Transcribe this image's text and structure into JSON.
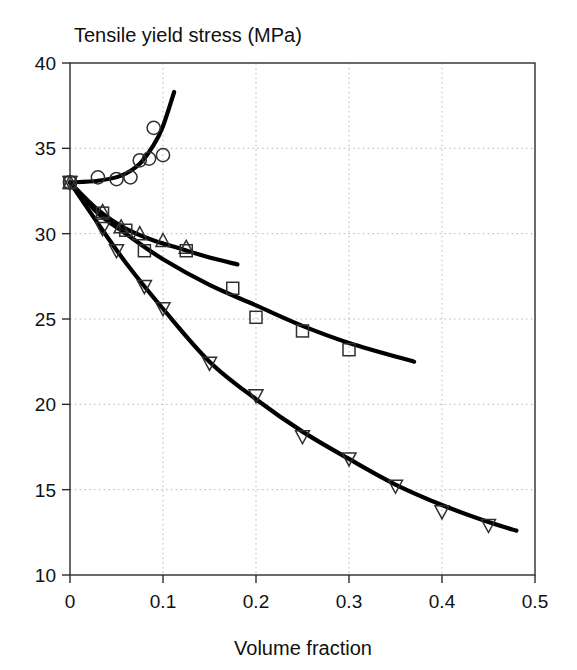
{
  "chart_data": {
    "type": "scatter",
    "title": "Tensile yield stress (MPa)",
    "xlabel": "Volume fraction",
    "ylabel": "Tensile yield stress (MPa)",
    "xlim": [
      0,
      0.5
    ],
    "ylim": [
      10,
      40
    ],
    "xticks": [
      0,
      0.1,
      0.2,
      0.3,
      0.4,
      0.5
    ],
    "xtick_labels": [
      "0",
      "0.1",
      "0.2",
      "0.3",
      "0.4",
      "0.5"
    ],
    "yticks": [
      10,
      15,
      20,
      25,
      30,
      35,
      40
    ],
    "ytick_labels": [
      "10",
      "15",
      "20",
      "25",
      "30",
      "35",
      "40"
    ],
    "grid": true,
    "legend": "none",
    "series": [
      {
        "name": "circles-rising",
        "marker": "circle",
        "points": [
          {
            "x": 0.0,
            "y": 33.0
          },
          {
            "x": 0.03,
            "y": 33.3
          },
          {
            "x": 0.05,
            "y": 33.2
          },
          {
            "x": 0.065,
            "y": 33.3
          },
          {
            "x": 0.075,
            "y": 34.3
          },
          {
            "x": 0.085,
            "y": 34.4
          },
          {
            "x": 0.09,
            "y": 36.2
          },
          {
            "x": 0.1,
            "y": 34.6
          }
        ],
        "curve": [
          {
            "x": 0.0,
            "y": 33.0
          },
          {
            "x": 0.03,
            "y": 33.1
          },
          {
            "x": 0.055,
            "y": 33.4
          },
          {
            "x": 0.075,
            "y": 34.1
          },
          {
            "x": 0.09,
            "y": 35.2
          },
          {
            "x": 0.1,
            "y": 36.3
          },
          {
            "x": 0.112,
            "y": 38.3
          }
        ]
      },
      {
        "name": "up-triangles",
        "marker": "triangle-up",
        "points": [
          {
            "x": 0.0,
            "y": 33.0
          },
          {
            "x": 0.035,
            "y": 31.3
          },
          {
            "x": 0.055,
            "y": 30.4
          },
          {
            "x": 0.075,
            "y": 30.0
          },
          {
            "x": 0.1,
            "y": 29.6
          },
          {
            "x": 0.125,
            "y": 29.2
          }
        ],
        "curve": [
          {
            "x": 0.0,
            "y": 33.0
          },
          {
            "x": 0.03,
            "y": 31.4
          },
          {
            "x": 0.06,
            "y": 30.3
          },
          {
            "x": 0.09,
            "y": 29.6
          },
          {
            "x": 0.12,
            "y": 29.1
          },
          {
            "x": 0.15,
            "y": 28.6
          },
          {
            "x": 0.18,
            "y": 28.2
          }
        ]
      },
      {
        "name": "squares",
        "marker": "square",
        "points": [
          {
            "x": 0.0,
            "y": 33.0
          },
          {
            "x": 0.035,
            "y": 31.2
          },
          {
            "x": 0.06,
            "y": 30.2
          },
          {
            "x": 0.08,
            "y": 29.0
          },
          {
            "x": 0.125,
            "y": 29.0
          },
          {
            "x": 0.175,
            "y": 26.8
          },
          {
            "x": 0.2,
            "y": 25.1
          },
          {
            "x": 0.25,
            "y": 24.3
          },
          {
            "x": 0.3,
            "y": 23.2
          }
        ],
        "curve": [
          {
            "x": 0.0,
            "y": 33.0
          },
          {
            "x": 0.03,
            "y": 31.2
          },
          {
            "x": 0.06,
            "y": 30.0
          },
          {
            "x": 0.1,
            "y": 28.5
          },
          {
            "x": 0.15,
            "y": 27.0
          },
          {
            "x": 0.2,
            "y": 25.8
          },
          {
            "x": 0.25,
            "y": 24.6
          },
          {
            "x": 0.3,
            "y": 23.6
          },
          {
            "x": 0.37,
            "y": 22.5
          }
        ]
      },
      {
        "name": "down-triangles",
        "marker": "triangle-down",
        "points": [
          {
            "x": 0.0,
            "y": 33.0
          },
          {
            "x": 0.035,
            "y": 30.3
          },
          {
            "x": 0.05,
            "y": 29.0
          },
          {
            "x": 0.08,
            "y": 26.9
          },
          {
            "x": 0.1,
            "y": 25.6
          },
          {
            "x": 0.15,
            "y": 22.4
          },
          {
            "x": 0.2,
            "y": 20.5
          },
          {
            "x": 0.25,
            "y": 18.1
          },
          {
            "x": 0.3,
            "y": 16.8
          },
          {
            "x": 0.35,
            "y": 15.2
          },
          {
            "x": 0.4,
            "y": 13.7
          },
          {
            "x": 0.45,
            "y": 12.9
          }
        ],
        "curve": [
          {
            "x": 0.0,
            "y": 33.0
          },
          {
            "x": 0.03,
            "y": 30.6
          },
          {
            "x": 0.06,
            "y": 28.3
          },
          {
            "x": 0.1,
            "y": 25.6
          },
          {
            "x": 0.15,
            "y": 22.5
          },
          {
            "x": 0.2,
            "y": 20.3
          },
          {
            "x": 0.25,
            "y": 18.4
          },
          {
            "x": 0.3,
            "y": 16.8
          },
          {
            "x": 0.35,
            "y": 15.3
          },
          {
            "x": 0.4,
            "y": 14.1
          },
          {
            "x": 0.45,
            "y": 13.1
          },
          {
            "x": 0.48,
            "y": 12.6
          }
        ]
      }
    ]
  }
}
